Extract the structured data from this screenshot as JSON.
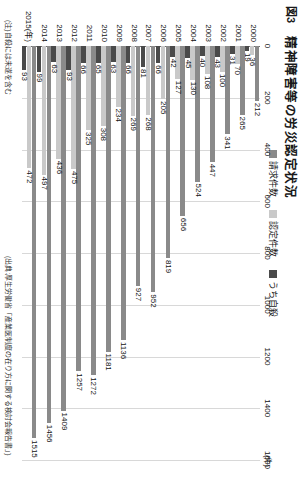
{
  "figure": {
    "number": "図3",
    "title": "精神障害等の労災認定状況",
    "axis_unit": "(件)",
    "note": "(注)自殺には未遂を含む",
    "source": "(出典:厚生労働省「産業医制度の在り方に関する検討会報告書」)"
  },
  "legend": {
    "items": [
      {
        "label": "請求件数",
        "color": "#8a8a8a"
      },
      {
        "label": "認定件数",
        "color": "#c9c9c9"
      },
      {
        "label": "うち自殺",
        "color": "#4a4a4a"
      }
    ]
  },
  "chart_data": {
    "type": "bar",
    "orientation": "horizontal",
    "title": "精神障害等の労災認定状況",
    "xlabel": "(件)",
    "ylabel": "(年)",
    "xlim": [
      0,
      1600
    ],
    "xticks": [
      0,
      200,
      400,
      600,
      800,
      1000,
      1200,
      1400,
      1600
    ],
    "grid": true,
    "legend_position": "top-right",
    "year_axis_label": "(年)",
    "categories": [
      "2000",
      "2001",
      "2002",
      "2003",
      "2004",
      "2005",
      "2006",
      "2007",
      "2008",
      "2009",
      "2010",
      "2011",
      "2012",
      "2013",
      "2014",
      "2015"
    ],
    "series": [
      {
        "name": "請求件数",
        "color": "#8a8a8a",
        "values": [
          212,
          265,
          341,
          447,
          524,
          656,
          819,
          952,
          927,
          1136,
          1181,
          1272,
          1257,
          1409,
          1456,
          1515
        ]
      },
      {
        "name": "認定件数",
        "color": "#c9c9c9",
        "values": [
          36,
          70,
          100,
          108,
          130,
          127,
          205,
          268,
          269,
          234,
          308,
          325,
          475,
          436,
          497,
          472
        ]
      },
      {
        "name": "うち自殺",
        "color": "#4a4a4a",
        "values": [
          19,
          31,
          43,
          40,
          45,
          42,
          66,
          81,
          66,
          63,
          65,
          66,
          93,
          63,
          99,
          93
        ]
      }
    ]
  }
}
